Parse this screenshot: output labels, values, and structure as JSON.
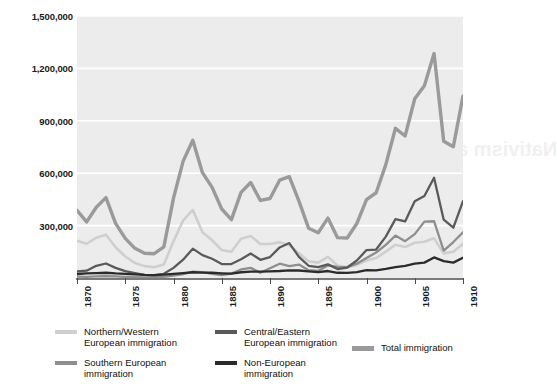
{
  "chart_data": {
    "type": "line",
    "title": "",
    "xlabel": "",
    "ylabel": "",
    "xlim": [
      1870,
      1910
    ],
    "ylim": [
      0,
      1500000
    ],
    "grid": true,
    "legend_position": "bottom",
    "ytick_labels": [
      "1,500,000",
      "1,200,000",
      "900,000",
      "600,000",
      "300,000"
    ],
    "ytick_values": [
      1500000,
      1200000,
      900000,
      600000,
      300000
    ],
    "xtick_labels": [
      "1870",
      "1875",
      "1880",
      "1885",
      "1890",
      "1895",
      "1900",
      "1905",
      "1910"
    ],
    "xtick_values": [
      1870,
      1875,
      1880,
      1885,
      1890,
      1895,
      1900,
      1905,
      1910
    ],
    "x": [
      1870,
      1871,
      1872,
      1873,
      1874,
      1875,
      1876,
      1877,
      1878,
      1879,
      1880,
      1881,
      1882,
      1883,
      1884,
      1885,
      1886,
      1887,
      1888,
      1889,
      1890,
      1891,
      1892,
      1893,
      1894,
      1895,
      1896,
      1897,
      1898,
      1899,
      1900,
      1901,
      1902,
      1903,
      1904,
      1905,
      1906,
      1907,
      1908,
      1909,
      1910
    ],
    "series": [
      {
        "name": "Total immigration",
        "color": "#9a9a9a",
        "width": 3.4,
        "values": [
          387000,
          321000,
          405000,
          460000,
          313000,
          227000,
          170000,
          142000,
          139000,
          178000,
          457000,
          669000,
          789000,
          603000,
          519000,
          395000,
          334000,
          490000,
          547000,
          444000,
          455000,
          560000,
          580000,
          440000,
          285000,
          259000,
          343000,
          231000,
          229000,
          312000,
          449000,
          488000,
          649000,
          857000,
          813000,
          1026000,
          1101000,
          1285000,
          783000,
          752000,
          1041000
        ]
      },
      {
        "name": "Northern/Western European immigration",
        "color": "#cfcfcf",
        "width": 2.6,
        "values": [
          213000,
          196000,
          231000,
          248000,
          176000,
          123000,
          86000,
          68000,
          62000,
          78000,
          210000,
          330000,
          390000,
          262000,
          216000,
          160000,
          150000,
          225000,
          240000,
          195000,
          195000,
          205000,
          188000,
          142000,
          96000,
          88000,
          121000,
          72000,
          62000,
          75000,
          101000,
          114000,
          151000,
          190000,
          177000,
          202000,
          208000,
          227000,
          141000,
          150000,
          196000
        ]
      },
      {
        "name": "Southern European immigration",
        "color": "#8e8e8e",
        "width": 2.3,
        "values": [
          8000,
          7000,
          9000,
          11000,
          9000,
          7000,
          5000,
          4000,
          5000,
          7000,
          14000,
          22000,
          36000,
          34000,
          24000,
          16000,
          25000,
          49000,
          58000,
          30000,
          56000,
          82000,
          68000,
          77000,
          45000,
          41000,
          72000,
          64000,
          62000,
          82000,
          115000,
          146000,
          190000,
          243000,
          211000,
          251000,
          323000,
          325000,
          157000,
          206000,
          262000
        ]
      },
      {
        "name": "Central/Eastern European immigration",
        "color": "#5a5a5a",
        "width": 2.3,
        "values": [
          38000,
          42000,
          70000,
          83000,
          58000,
          39000,
          28000,
          18000,
          17000,
          24000,
          58000,
          105000,
          168000,
          131000,
          110000,
          80000,
          80000,
          107000,
          140000,
          104000,
          120000,
          175000,
          200000,
          121000,
          70000,
          62000,
          78000,
          51000,
          60000,
          100000,
          160000,
          163000,
          237000,
          337000,
          324000,
          439000,
          469000,
          574000,
          334000,
          288000,
          440000
        ]
      },
      {
        "name": "Non-European immigration",
        "color": "#2b2b2b",
        "width": 2.3,
        "values": [
          23000,
          26000,
          28000,
          30000,
          26000,
          24000,
          21000,
          18000,
          17000,
          19000,
          24000,
          28000,
          33000,
          31000,
          30000,
          27000,
          25000,
          33000,
          37000,
          36000,
          38000,
          40000,
          44000,
          43000,
          38000,
          34000,
          40000,
          30000,
          29000,
          34000,
          45000,
          44000,
          52000,
          62000,
          70000,
          82000,
          88000,
          118000,
          97000,
          88000,
          116000
        ]
      }
    ]
  },
  "legend": {
    "items": [
      {
        "label": "Northern/Western\nEuropean immigration",
        "color": "#cfcfcf",
        "key": "northern-western-european-immigration"
      },
      {
        "label": "Southern European\nimmigration",
        "color": "#8e8e8e",
        "key": "southern-european-immigration"
      },
      {
        "label": "Central/Eastern\nEuropean immigration",
        "color": "#5a5a5a",
        "key": "central-eastern-european-immigration"
      },
      {
        "label": "Non-European\nimmigration",
        "color": "#2b2b2b",
        "key": "non-european-immigration"
      },
      {
        "label": "Total immigration",
        "color": "#9a9a9a",
        "key": "total-immigration"
      }
    ]
  },
  "bleed_through": {
    "line1": "Nativism and the Cry for Immigration Restriction"
  }
}
